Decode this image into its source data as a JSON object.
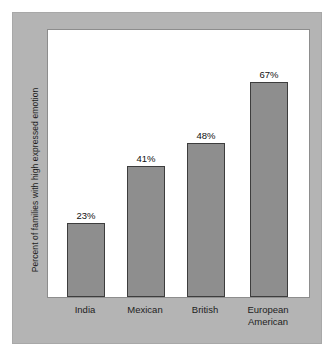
{
  "chart_data": {
    "type": "bar",
    "title": "",
    "subtitle": "",
    "xlabel": "",
    "ylabel": "Percent of families with high expressed emotion",
    "categories": [
      "India",
      "Mexican",
      "British",
      "European\nAmerican"
    ],
    "values": [
      23,
      41,
      48,
      67
    ],
    "value_labels": [
      "23%",
      "41%",
      "48%",
      "67%"
    ],
    "ylim": [
      0,
      84
    ],
    "grid": false,
    "legend": null,
    "series": [
      {
        "name": "Percent of families with high expressed emotion",
        "values": [
          23,
          41,
          48,
          67
        ]
      }
    ],
    "annotations": [],
    "colors": {
      "bar_fill": "#8e8e8e",
      "bar_border": "#3d3d3d",
      "plot_background": "#ffffff",
      "frame_background": "#b4b4b4",
      "page_background": "#ffffff",
      "text": "#1d1d1d"
    }
  }
}
